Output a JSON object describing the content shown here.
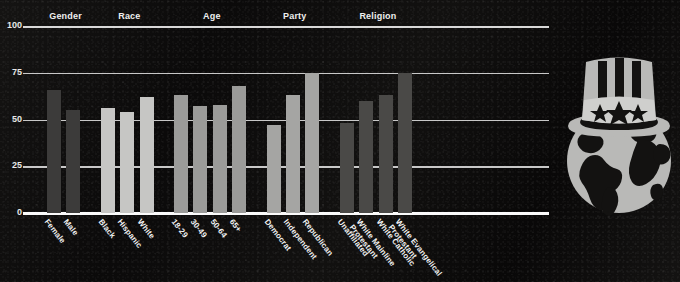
{
  "chart_data": {
    "type": "bar",
    "title": "",
    "xlabel": "",
    "ylabel": "",
    "ylim": [
      0,
      100
    ],
    "yticks": [
      "0",
      "25",
      "50",
      "75",
      "100"
    ],
    "grid": true,
    "legend": "none",
    "groups": [
      {
        "name": "Gender",
        "color": "#3c3b3a",
        "categories": [
          "Female",
          "Male"
        ],
        "values": [
          66,
          55
        ]
      },
      {
        "name": "Race",
        "color": "#c6c6c4",
        "categories": [
          "Black",
          "Hispanic",
          "White"
        ],
        "values": [
          56,
          54,
          62
        ]
      },
      {
        "name": "Age",
        "color": "#9b9b99",
        "categories": [
          "18-29",
          "30-49",
          "50-64",
          "65+"
        ],
        "values": [
          63,
          57,
          58,
          68
        ]
      },
      {
        "name": "Party",
        "color": "#a5a5a3",
        "categories": [
          "Democrat",
          "Independent",
          "Republican"
        ],
        "values": [
          47,
          63,
          75
        ]
      },
      {
        "name": "Religion",
        "color": "#4a4947",
        "categories": [
          "Unaffiliated",
          "White Mainline Protestant",
          "White Catholic",
          "White Evangelical Protestant"
        ],
        "values": [
          48,
          60,
          63,
          75
        ]
      }
    ]
  },
  "logo": {
    "name": "uncle-sam-globe-logo",
    "stars": 3,
    "hat_color": "#b9b9b7",
    "globe_color": "#b9b9b7",
    "land_color": "#1a1918"
  },
  "colors": {
    "background": "#0d0c0c",
    "axis": "#fbfbfb",
    "grid": "#e9e9e9",
    "text": "#f2f2f2"
  }
}
